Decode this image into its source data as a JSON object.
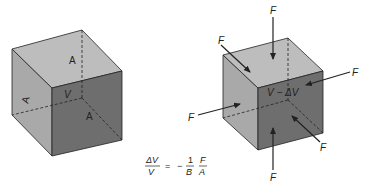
{
  "diagram": {
    "colors": {
      "face_light": "#a9a9a9",
      "face_front": "#6e6e6e",
      "face_top": "#bdbdbd",
      "edge": "#222222",
      "arrow": "#222222",
      "background": "#ffffff"
    },
    "left_cube": {
      "area_label_top": "A",
      "area_label_bottom": "A",
      "area_label_side": "A",
      "volume_label": "V"
    },
    "right_cube": {
      "volume_label": "V − ΔV",
      "force_label": "F",
      "force_count": 6
    },
    "equation": {
      "lhs_numerator": "ΔV",
      "lhs_denominator": "V",
      "equals": "=",
      "minus": "−",
      "coef_numerator": "1",
      "coef_denominator": "B",
      "rhs_numerator": "F",
      "rhs_denominator": "A"
    }
  }
}
